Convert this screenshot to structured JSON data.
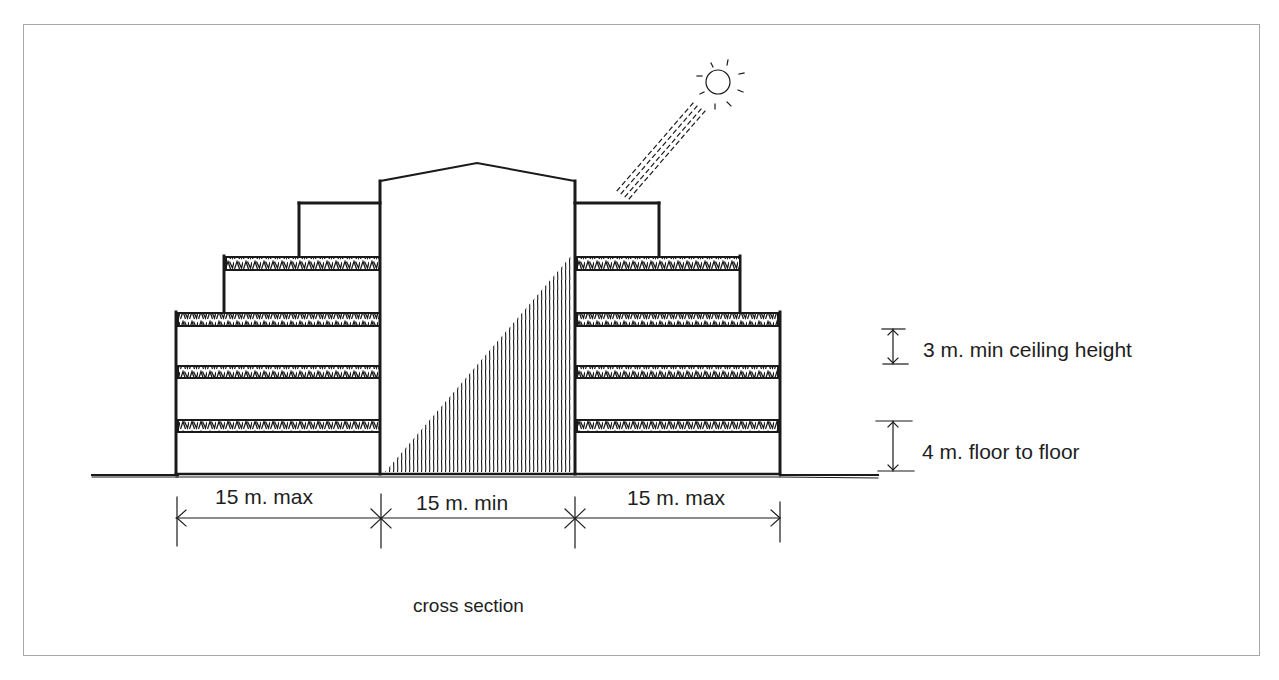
{
  "diagram": {
    "type": "architectural cross section",
    "caption": "cross section",
    "dimensions": {
      "left_wing_width": "15 m. max",
      "center_width": "15 m. min",
      "right_wing_width": "15 m. max",
      "ceiling_height": "3 m. min ceiling height",
      "floor_to_floor": "4 m. floor to floor"
    },
    "elements": {
      "sun": "sun-icon",
      "sun_rays": "sunlight-rays",
      "central_tower": "central-atrium-tower",
      "shadow": "hatched-shadow",
      "left_wing_floors": 4,
      "right_wing_floors": 4
    },
    "colors": {
      "line": "#1a1a1a",
      "frame": "#a8a8a8",
      "background": "#ffffff"
    }
  }
}
